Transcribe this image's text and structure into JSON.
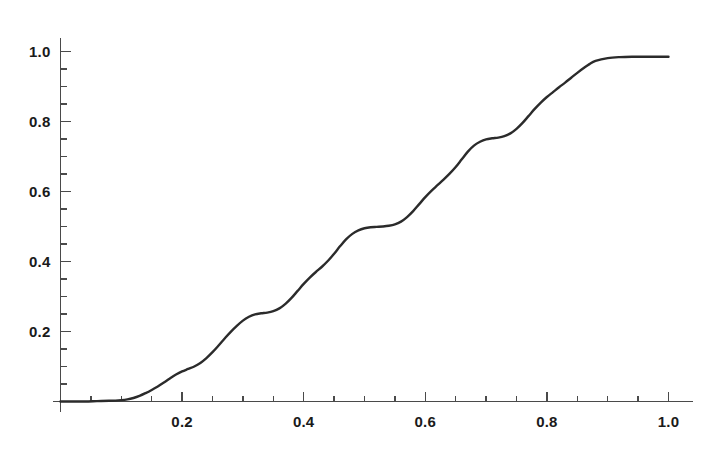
{
  "figure": {
    "background_color": "#ffffff",
    "line_color": "#2b2b2b",
    "axis_color": "#4a4a4a",
    "text_color": "#1a1a1a"
  },
  "chart_data": {
    "type": "line",
    "title": "",
    "subtitle": "",
    "xlabel": "",
    "ylabel": "",
    "xlim": [
      0.0,
      1.04
    ],
    "ylim": [
      0.0,
      1.04
    ],
    "grid": false,
    "legend": null,
    "legend_position": "none",
    "x_axis": {
      "major_ticks": [
        0.2,
        0.4,
        0.6,
        0.8,
        1.0
      ],
      "major_tick_labels": [
        "0.2",
        "0.4",
        "0.6",
        "0.8",
        "1.0"
      ],
      "minor_tick_step": 0.05,
      "tick_direction": "up",
      "range_drawn": [
        0.0,
        1.04
      ]
    },
    "y_axis": {
      "major_ticks": [
        0.2,
        0.4,
        0.6,
        0.8,
        1.0
      ],
      "major_tick_labels": [
        "0.2",
        "0.4",
        "0.6",
        "0.8",
        "1.0"
      ],
      "minor_tick_step": 0.05,
      "tick_direction": "right",
      "range_drawn": [
        0.0,
        1.04
      ]
    },
    "series": [
      {
        "name": "cdf",
        "color": "#2b2b2b",
        "line_width": 2.4,
        "x": [
          0.0,
          0.02,
          0.04,
          0.06,
          0.08,
          0.1,
          0.11,
          0.12,
          0.13,
          0.14,
          0.15,
          0.16,
          0.17,
          0.18,
          0.19,
          0.2,
          0.21,
          0.22,
          0.23,
          0.24,
          0.25,
          0.26,
          0.27,
          0.28,
          0.29,
          0.3,
          0.31,
          0.32,
          0.33,
          0.34,
          0.35,
          0.36,
          0.37,
          0.38,
          0.39,
          0.4,
          0.41,
          0.42,
          0.43,
          0.44,
          0.45,
          0.46,
          0.47,
          0.48,
          0.49,
          0.5,
          0.51,
          0.52,
          0.53,
          0.54,
          0.55,
          0.56,
          0.57,
          0.58,
          0.59,
          0.6,
          0.61,
          0.62,
          0.63,
          0.64,
          0.65,
          0.66,
          0.67,
          0.68,
          0.69,
          0.7,
          0.71,
          0.72,
          0.73,
          0.74,
          0.75,
          0.76,
          0.77,
          0.78,
          0.79,
          0.8,
          0.81,
          0.82,
          0.83,
          0.84,
          0.85,
          0.86,
          0.87,
          0.88,
          0.9,
          0.92,
          0.94,
          0.96,
          0.98,
          1.0
        ],
        "y": [
          0.0,
          0.0,
          0.0,
          0.001,
          0.002,
          0.004,
          0.006,
          0.01,
          0.016,
          0.024,
          0.033,
          0.043,
          0.054,
          0.066,
          0.077,
          0.086,
          0.093,
          0.1,
          0.11,
          0.124,
          0.141,
          0.16,
          0.18,
          0.199,
          0.216,
          0.231,
          0.242,
          0.249,
          0.252,
          0.254,
          0.258,
          0.266,
          0.279,
          0.296,
          0.316,
          0.336,
          0.354,
          0.37,
          0.385,
          0.402,
          0.422,
          0.444,
          0.464,
          0.479,
          0.489,
          0.495,
          0.498,
          0.499,
          0.5,
          0.502,
          0.506,
          0.514,
          0.527,
          0.544,
          0.564,
          0.584,
          0.602,
          0.618,
          0.634,
          0.651,
          0.67,
          0.692,
          0.714,
          0.731,
          0.742,
          0.749,
          0.752,
          0.754,
          0.758,
          0.766,
          0.779,
          0.796,
          0.816,
          0.836,
          0.854,
          0.87,
          0.884,
          0.898,
          0.911,
          0.925,
          0.939,
          0.952,
          0.964,
          0.973,
          0.981,
          0.984,
          0.985,
          0.985,
          0.985,
          0.985
        ],
        "style": "solid"
      }
    ]
  }
}
